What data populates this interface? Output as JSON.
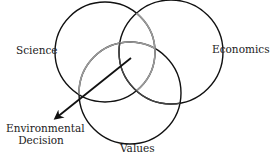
{
  "diagram": {
    "type": "venn",
    "sets": [
      {
        "name": "Science",
        "cx": 105,
        "cy": 52,
        "r": 50,
        "stroke": "#111111"
      },
      {
        "name": "Economics",
        "cx": 171,
        "cy": 52,
        "r": 52,
        "stroke": "#111111"
      },
      {
        "name": "Values",
        "cx": 130,
        "cy": 93,
        "r": 51,
        "stroke": "#111111"
      }
    ],
    "arrow": {
      "from": [
        131,
        58
      ],
      "to": [
        54,
        120
      ],
      "color": "#111111"
    },
    "labels": {
      "science": "Science",
      "economics": "Economics",
      "values": "Values",
      "decision_line1": "Environmental",
      "decision_line2": "Decision"
    }
  }
}
